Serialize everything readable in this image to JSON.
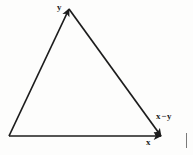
{
  "figure": {
    "name": "vector-subtraction-triangle",
    "background_color": "#fdfdfc",
    "ink_color": "#1c1c1c",
    "width": 193,
    "height": 155
  },
  "labels": {
    "y": "y",
    "x_minus_y_left": "x",
    "x_minus_y_operator": "−",
    "x_minus_y_right": "y",
    "x": "x"
  },
  "chart_data": {
    "type": "diagram",
    "title": "",
    "subtitle": "",
    "xlabel": "",
    "ylabel": "",
    "vectors": [
      {
        "name": "y",
        "label": "y",
        "from": [
          9,
          136
        ],
        "to": [
          69,
          9
        ],
        "arrowhead": "at-tip",
        "label_position": [
          57,
          3
        ]
      },
      {
        "name": "x",
        "label": "x",
        "from": [
          9,
          136
        ],
        "to": [
          161,
          136
        ],
        "arrowhead": "at-tip",
        "label_position": [
          146,
          138
        ]
      },
      {
        "name": "x-minus-y",
        "label": "x − y",
        "from": [
          69,
          9
        ],
        "to": [
          161,
          136
        ],
        "arrowhead": "at-tip",
        "label_position": [
          156,
          112
        ]
      }
    ],
    "vertices": [
      {
        "name": "origin",
        "point": [
          9,
          136
        ]
      },
      {
        "name": "apex",
        "point": [
          69,
          9
        ]
      },
      {
        "name": "right",
        "point": [
          161,
          136
        ]
      }
    ],
    "grid": false,
    "legend": "none"
  }
}
